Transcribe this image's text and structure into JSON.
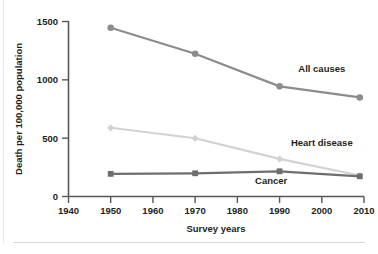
{
  "chart_data": {
    "type": "line",
    "title": "",
    "xlabel": "Survey years",
    "ylabel": "Death per 100,000 population",
    "x": [
      1950,
      1970,
      1990,
      2009
    ],
    "xlim": [
      1940,
      2010
    ],
    "ylim": [
      0,
      1500
    ],
    "xticks": [
      "1940",
      "1950",
      "1960",
      "1970",
      "1980",
      "1990",
      "2000",
      "2010"
    ],
    "xtick_values": [
      1940,
      1950,
      1960,
      1970,
      1980,
      1990,
      2000,
      2010
    ],
    "yticks": [
      "0",
      "500",
      "1000",
      "1500"
    ],
    "ytick_values": [
      0,
      500,
      1000,
      1500
    ],
    "grid": false,
    "legend": "inline-labels",
    "series": [
      {
        "name": "All causes",
        "values": [
          1446,
          1223,
          944,
          849
        ],
        "color": "#8c8c8c",
        "marker": "circle",
        "label_x": 2000,
        "label_y": 1065
      },
      {
        "name": "Heart disease",
        "values": [
          589,
          499,
          322,
          180
        ],
        "color": "#d2d2d2",
        "marker": "diamond",
        "label_x": 2000,
        "label_y": 430
      },
      {
        "name": "Cancer",
        "values": [
          194,
          199,
          216,
          173
        ],
        "color": "#6e6e6e",
        "marker": "square",
        "label_x": 1988,
        "label_y": 105
      }
    ]
  },
  "axis": {
    "xlabel": "Survey years",
    "ylabel": "Death per 100,000 population",
    "xtick_labels": [
      "1940",
      "1950",
      "1960",
      "1970",
      "1980",
      "1990",
      "2000",
      "2010"
    ],
    "ytick_labels": [
      "0",
      "500",
      "1000",
      "1500"
    ]
  },
  "series_labels": {
    "all_causes": "All causes",
    "heart_disease": "Heart disease",
    "cancer": "Cancer"
  },
  "colors": {
    "all_causes": "#8c8c8c",
    "heart_disease": "#d2d2d2",
    "cancer": "#6e6e6e",
    "axis": "#58585a",
    "text": "#231f20",
    "background": "#ffffff",
    "rule": "#d7d7d7"
  }
}
